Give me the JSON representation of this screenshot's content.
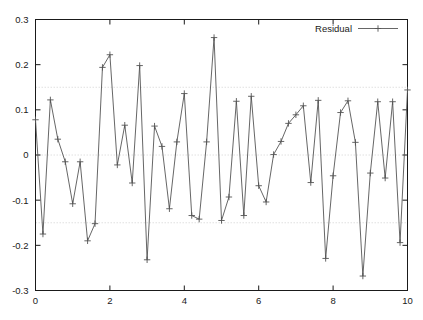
{
  "chart_data": {
    "type": "line",
    "title": "",
    "xlabel": "",
    "ylabel": "",
    "xlim": [
      0,
      10
    ],
    "ylim": [
      -0.3,
      0.3
    ],
    "grid": true,
    "grid_y_values": [
      0.15,
      0,
      -0.15
    ],
    "legend_position": "top-right",
    "xticks": [
      0,
      2,
      4,
      6,
      8,
      10
    ],
    "xtick_labels": [
      "0",
      "2",
      "4",
      "6",
      "8",
      "10"
    ],
    "yticks": [
      0.3,
      0.2,
      0.1,
      0,
      -0.1,
      -0.2,
      -0.3
    ],
    "ytick_labels": [
      "0.3",
      "0.2",
      "0.1",
      "0",
      "-0.1",
      "-0.2",
      "-0.3"
    ],
    "marker": "plus",
    "line_color": "#555555",
    "series": [
      {
        "name": "Residual",
        "x": [
          0.0,
          0.2,
          0.4,
          0.6,
          0.8,
          1.0,
          1.2,
          1.4,
          1.6,
          1.8,
          2.0,
          2.2,
          2.4,
          2.6,
          2.8,
          3.0,
          3.2,
          3.4,
          3.6,
          3.8,
          4.0,
          4.2,
          4.4,
          4.6,
          4.8,
          5.0,
          5.2,
          5.4,
          5.6,
          5.8,
          6.0,
          6.2,
          6.4,
          6.6,
          6.8,
          7.0,
          7.2,
          7.4,
          7.6,
          7.8,
          8.0,
          8.2,
          8.4,
          8.6,
          8.8,
          9.0,
          9.2,
          9.4,
          9.6,
          9.8,
          10.0
        ],
        "values": [
          0.078,
          -0.175,
          0.122,
          0.035,
          -0.015,
          -0.108,
          -0.015,
          -0.19,
          -0.152,
          0.194,
          0.222,
          -0.022,
          0.066,
          -0.062,
          0.198,
          -0.232,
          0.064,
          0.019,
          -0.119,
          0.029,
          0.136,
          -0.134,
          -0.142,
          0.029,
          0.26,
          -0.145,
          -0.093,
          0.119,
          -0.134,
          0.13,
          -0.068,
          -0.104,
          0.001,
          0.03,
          0.07,
          0.089,
          0.109,
          -0.061,
          0.121,
          -0.229,
          -0.046,
          0.094,
          0.12,
          0.028,
          -0.268,
          -0.04,
          0.118,
          -0.051,
          0.118,
          -0.194,
          0.144
        ]
      }
    ]
  },
  "legend": {
    "entries": [
      {
        "label": "Residual"
      }
    ]
  },
  "axes": {
    "y_tick_labels": [
      "0.3",
      "0.2",
      "0.1",
      "0",
      "-0.1",
      "-0.2",
      "-0.3"
    ],
    "x_tick_labels": [
      "0",
      "2",
      "4",
      "6",
      "8",
      "10"
    ]
  },
  "colors": {
    "line": "#555555",
    "frame": "#1a1a1a",
    "grid": "#d8d8d8",
    "background": "#ffffff",
    "text": "#1a1a1a"
  }
}
